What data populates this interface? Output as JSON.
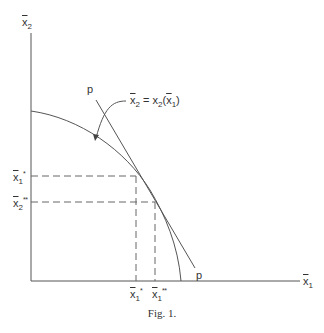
{
  "figure": {
    "caption": "Fig. 1.",
    "axes": {
      "x_label": {
        "base": "x",
        "sub": "1"
      },
      "y_label": {
        "base": "x",
        "sub": "2"
      }
    },
    "curve_label": {
      "lhs_base": "x",
      "lhs_sub": "2",
      "eq": " = x",
      "rhs_sub": "2",
      "arg_open": "(",
      "arg_base": "x",
      "arg_sub": "1",
      "arg_close": ")"
    },
    "price_line_label_top": "p",
    "price_line_label_bottom": "p",
    "y_ticks": [
      {
        "base": "x",
        "sub": "1",
        "sup": "*"
      },
      {
        "base": "x",
        "sub": "2",
        "sup": "**"
      }
    ],
    "x_ticks": [
      {
        "base": "x",
        "sub": "1",
        "sup": "*"
      },
      {
        "base": "x",
        "sub": "1",
        "sup": "**"
      }
    ],
    "colors": {
      "line": "#555555",
      "text": "#333333",
      "background": "#ffffff"
    }
  }
}
